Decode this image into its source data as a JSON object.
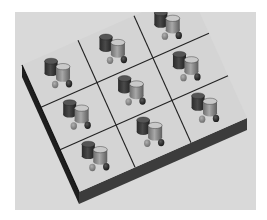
{
  "scene": {
    "description": "Grayscale 3D render of a square board divided into a 3x3 grid, each cell holding two tall cylinders and two small knobs",
    "grid": {
      "rows": 3,
      "cols": 3
    },
    "colors": {
      "page_background": "#ffffff",
      "frame_background": "#d9d9d9",
      "board_top": "#d4d4d4",
      "board_side": "#3c3c3c",
      "board_edge_left": "#1e1e1e",
      "grid_line": "#222222",
      "dark_cylinder": "#3a3a3a",
      "dark_cylinder_top": "#555555",
      "light_cylinder": "#8f8f8f",
      "light_cylinder_top": "#c9c9c9",
      "small_knob_light": "#8a8a8a",
      "small_knob_dark": "#2a2a2a"
    },
    "frame": {
      "x": 15,
      "y": 12,
      "width": 241,
      "height": 198
    },
    "board": {
      "corners": {
        "left": [
          22,
          65
        ],
        "top": [
          190,
          -9
        ],
        "right": [
          247,
          118
        ],
        "bottom": [
          79,
          192
        ]
      },
      "thickness": 12
    },
    "cell_objects": [
      {
        "type": "dark-cylinder",
        "u": 0.34,
        "v": 0.38,
        "radius": 6.5,
        "height": 12
      },
      {
        "type": "light-cylinder",
        "u": 0.5,
        "v": 0.62,
        "radius": 7,
        "height": 12
      },
      {
        "type": "small-knob-light",
        "u": 0.3,
        "v": 0.74,
        "radius": 3.2
      },
      {
        "type": "small-knob-dark",
        "u": 0.54,
        "v": 0.86,
        "radius": 3.2
      }
    ]
  }
}
